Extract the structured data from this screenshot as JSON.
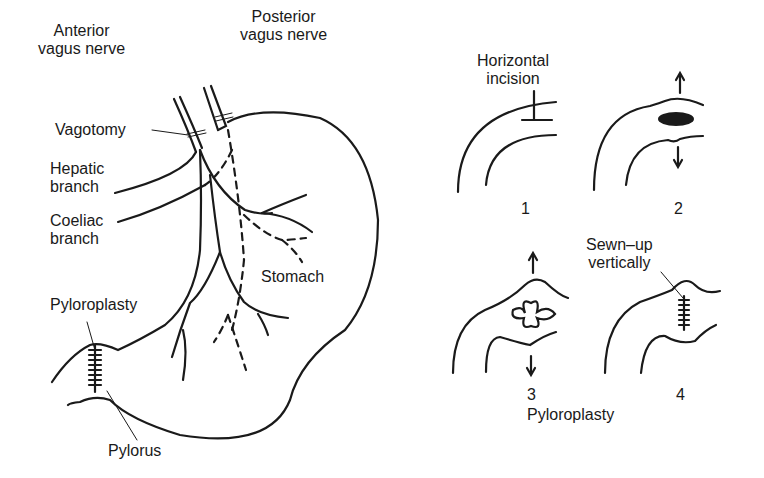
{
  "figure": {
    "left_panel": {
      "labels": {
        "anterior_vagus": [
          "Anterior",
          "vagus nerve"
        ],
        "posterior_vagus": [
          "Posterior",
          "vagus nerve"
        ],
        "vagotomy": "Vagotomy",
        "hepatic_branch": [
          "Hepatic",
          "branch"
        ],
        "coeliac_branch": [
          "Coeliac",
          "branch"
        ],
        "stomach": "Stomach",
        "pyloroplasty": "Pyloroplasty",
        "pylorus": "Pylorus"
      }
    },
    "right_panel": {
      "title": "Pyloroplasty",
      "steps": [
        {
          "number": "1",
          "annotation": [
            "Horizontal",
            "incision"
          ]
        },
        {
          "number": "2",
          "annotation": ""
        },
        {
          "number": "3",
          "annotation": ""
        },
        {
          "number": "4",
          "annotation": [
            "Sewn–up",
            "vertically"
          ]
        }
      ]
    },
    "colors": {
      "ink": "#1a1a1a",
      "background": "#ffffff"
    }
  }
}
